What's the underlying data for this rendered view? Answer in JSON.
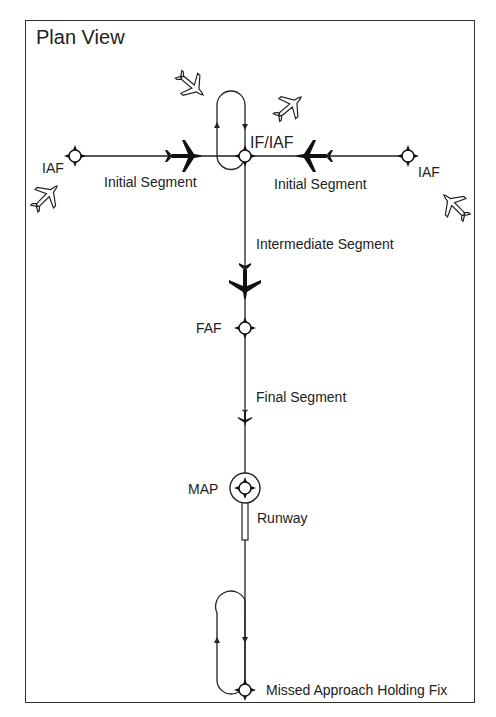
{
  "diagram": {
    "title": "Plan View",
    "labels": {
      "iaf_left": "IAF",
      "iaf_right": "IAF",
      "if_iaf": "IF/IAF",
      "initial_left": "Initial Segment",
      "initial_right": "Initial Segment",
      "intermediate": "Intermediate Segment",
      "faf": "FAF",
      "final": "Final Segment",
      "map": "MAP",
      "runway": "Runway",
      "missed_holding": "Missed Approach Holding Fix"
    }
  }
}
